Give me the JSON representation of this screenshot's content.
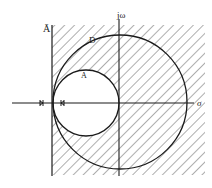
{
  "figure": {
    "type": "s-plane stability region diagram",
    "labels": {
      "a_bar": "Ā",
      "d": "D",
      "j_omega": "jω",
      "a": "A",
      "sigma": "σ"
    },
    "colors": {
      "line": "#1a1a1a",
      "hatch": "#333333",
      "background": "#ffffff"
    },
    "elements": {
      "real_axis": "σ axis (horizontal)",
      "imag_axis": "jω axis (vertical)",
      "boundary_line": "vertical line Ā, left edge of hatched region",
      "circle_d": "large circle D centered at origin",
      "circle_a": "small circle A tangent to jω axis at origin, interior unhatched",
      "markers": "two tick marks on real axis on either side of line Ā"
    }
  }
}
